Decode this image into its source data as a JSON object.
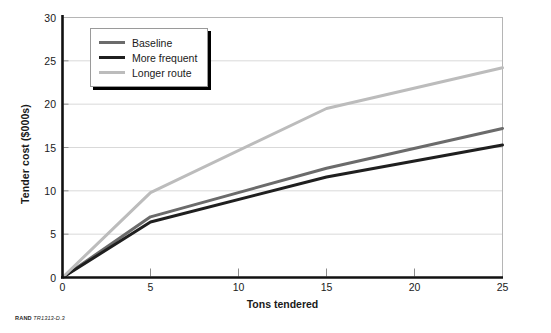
{
  "credit": {
    "organization": "RAND",
    "report_id": "TR1313-D.3"
  },
  "legend": {
    "position": "top-left-inside",
    "items": [
      {
        "label": "Baseline",
        "color": "#6b6b6b"
      },
      {
        "label": "More frequent",
        "color": "#1f1f1f"
      },
      {
        "label": "Longer route",
        "color": "#bcbcbc"
      }
    ]
  },
  "chart_data": {
    "type": "line",
    "title": "",
    "xlabel": "Tons tendered",
    "ylabel": "Tender cost ($000s)",
    "xlim": [
      0,
      25
    ],
    "ylim": [
      0,
      30
    ],
    "xticks": [
      0,
      5,
      10,
      15,
      20,
      25
    ],
    "yticks": [
      0,
      5,
      10,
      15,
      20,
      25,
      30
    ],
    "grid": "horizontal",
    "x": [
      0,
      5,
      15,
      25
    ],
    "series": [
      {
        "name": "Baseline",
        "color": "#6b6b6b",
        "values": [
          0,
          7.0,
          12.6,
          17.2
        ]
      },
      {
        "name": "More frequent",
        "color": "#1f1f1f",
        "values": [
          0,
          6.4,
          11.6,
          15.3
        ]
      },
      {
        "name": "Longer route",
        "color": "#bcbcbc",
        "values": [
          0,
          9.8,
          19.5,
          24.2
        ]
      }
    ]
  }
}
